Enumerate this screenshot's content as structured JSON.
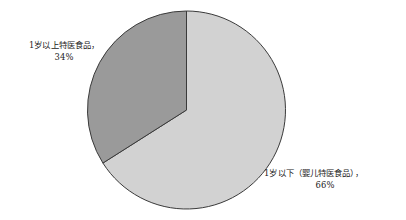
{
  "chart_data": {
    "type": "pie",
    "title": "",
    "subtitle": "",
    "xlabel": "",
    "ylabel": "",
    "legend_position": "none",
    "grid": false,
    "start_angle_deg": 0,
    "direction": "clockwise",
    "categories": [
      "1岁以下（婴儿特医食品）",
      "1岁以上特医食品"
    ],
    "values": [
      66,
      34
    ],
    "unit": "%",
    "slices": [
      {
        "name": "1岁以下（婴儿特医食品）",
        "label_text": "1岁以下（婴儿特医食品），",
        "value": 66,
        "value_label": "66%",
        "color": "#d2d2d2",
        "start_angle_deg": 0,
        "end_angle_deg": 237.6,
        "label_position": "right"
      },
      {
        "name": "1岁以上特医食品",
        "label_text": "1岁以上特医食品，",
        "value": 34,
        "value_label": "34%",
        "color": "#9a9a9a",
        "start_angle_deg": 237.6,
        "end_angle_deg": 360,
        "label_position": "left"
      }
    ]
  },
  "labels": {
    "left": {
      "text": "1岁以上特医食品，",
      "value": "34%"
    },
    "right": {
      "text": "1岁以下（婴儿特医食品），",
      "value": "66%"
    }
  },
  "colors": {
    "background": "#ffffff",
    "slice_light": "#d2d2d2",
    "slice_dark": "#9a9a9a",
    "outline": "#3a3a3a",
    "text": "#222222"
  },
  "geometry": {
    "center_x": 186.5,
    "center_y": 110,
    "radius": 99
  }
}
